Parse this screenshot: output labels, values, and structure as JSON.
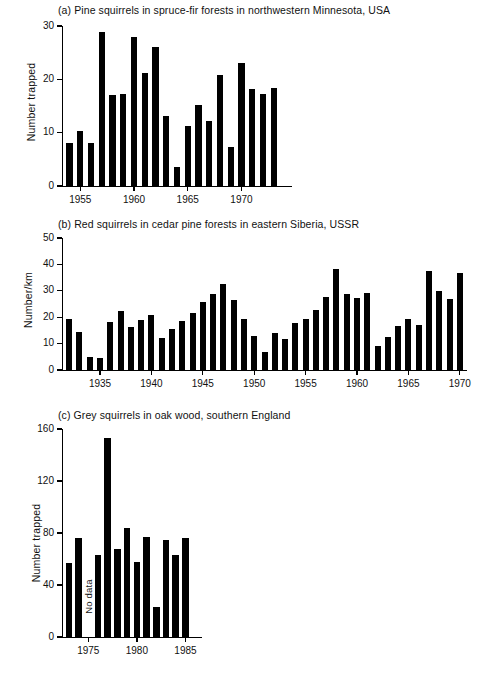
{
  "figure": {
    "panels": [
      {
        "key": "a",
        "caption": "(a)  Pine squirrels in spruce-fir forests in northwestern Minnesota, USA",
        "ylabel": "Number trapped",
        "yticks": [
          0,
          10,
          20,
          30
        ],
        "xticks": [
          1955,
          1960,
          1965,
          1970
        ]
      },
      {
        "key": "b",
        "caption": "(b)  Red squirrels in cedar pine forests in eastern Siberia, USSR",
        "ylabel": "Number/km",
        "yticks": [
          0,
          10,
          20,
          30,
          40,
          50
        ],
        "xticks": [
          1935,
          1940,
          1945,
          1950,
          1955,
          1960,
          1965,
          1970
        ]
      },
      {
        "key": "c",
        "caption": "(c)  Grey squirrels in oak wood, southern England",
        "ylabel": "Number trapped",
        "yticks": [
          0,
          40,
          80,
          120,
          160
        ],
        "xticks": [
          1975,
          1980,
          1985
        ],
        "annotation": "No data"
      }
    ]
  },
  "chart_data": [
    {
      "type": "bar",
      "panel": "a",
      "title": "(a)  Pine squirrels in spruce-fir forests in northwestern Minnesota, USA",
      "xlabel": "",
      "ylabel": "Number trapped",
      "ylim": [
        0,
        30
      ],
      "xlim": [
        1953.3,
        1974.7
      ],
      "grid": false,
      "legend": "none",
      "bar_color": "#000000",
      "categories": [
        1954,
        1955,
        1956,
        1957,
        1958,
        1959,
        1960,
        1961,
        1962,
        1963,
        1964,
        1965,
        1966,
        1967,
        1968,
        1969,
        1970,
        1971,
        1972,
        1973,
        1974
      ],
      "values": [
        8.1,
        10.3,
        8.1,
        28.8,
        17.1,
        17.3,
        27.9,
        21.2,
        26.0,
        13.2,
        3.6,
        11.2,
        15.2,
        12.1,
        20.9,
        7.4,
        23.1,
        18.2,
        17.2,
        18.3,
        0
      ],
      "missing": [
        1974
      ]
    },
    {
      "type": "bar",
      "panel": "b",
      "title": "(b)  Red squirrels in cedar pine forests in eastern Siberia, USSR",
      "xlabel": "",
      "ylabel": "Number/km",
      "ylim": [
        0,
        50
      ],
      "xlim": [
        1931.3,
        1970.7
      ],
      "grid": false,
      "legend": "none",
      "bar_color": "#000000",
      "categories": [
        1932,
        1933,
        1934,
        1935,
        1936,
        1937,
        1938,
        1939,
        1940,
        1941,
        1942,
        1943,
        1944,
        1945,
        1946,
        1947,
        1948,
        1949,
        1950,
        1951,
        1952,
        1953,
        1954,
        1955,
        1956,
        1957,
        1958,
        1959,
        1960,
        1961,
        1962,
        1963,
        1964,
        1965,
        1966,
        1967,
        1968,
        1969,
        1970
      ],
      "values": [
        19.3,
        14.5,
        5.1,
        4.6,
        18.3,
        22.5,
        16.2,
        19.0,
        20.9,
        12.2,
        15.4,
        18.6,
        21.7,
        25.6,
        28.8,
        32.6,
        26.4,
        19.2,
        12.7,
        6.9,
        14.2,
        11.6,
        17.9,
        19.3,
        22.9,
        27.5,
        38.1,
        28.7,
        27.3,
        29.0,
        9.2,
        12.5,
        16.8,
        19.5,
        17.2,
        37.4,
        30.0,
        26.9,
        36.6
      ]
    },
    {
      "type": "bar",
      "panel": "c",
      "title": "(c)  Grey squirrels in oak wood, southern England",
      "xlabel": "",
      "ylabel": "Number trapped",
      "ylim": [
        0,
        160
      ],
      "xlim": [
        1972.3,
        1986.7
      ],
      "grid": false,
      "legend": "none",
      "bar_color": "#000000",
      "annotation": "No data",
      "annotation_year": 1975,
      "categories": [
        1973,
        1974,
        1975,
        1976,
        1977,
        1978,
        1979,
        1980,
        1981,
        1982,
        1983,
        1984,
        1985
      ],
      "values": [
        57,
        76,
        null,
        63,
        153,
        68,
        84,
        58,
        77,
        23,
        75,
        63,
        76
      ],
      "missing": [
        1975
      ]
    }
  ]
}
